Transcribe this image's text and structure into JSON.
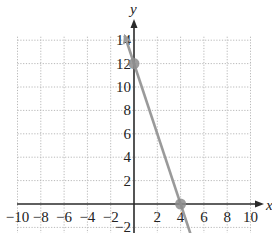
{
  "chart_data": {
    "type": "line",
    "title": "",
    "xlabel": "x",
    "ylabel": "y",
    "xlim": [
      -10,
      10
    ],
    "ylim": [
      -2,
      14
    ],
    "grid": true,
    "x_ticks": [
      -10,
      -8,
      -6,
      -4,
      -2,
      2,
      4,
      6,
      8,
      10
    ],
    "y_ticks": [
      -2,
      2,
      4,
      6,
      8,
      10,
      12,
      14
    ],
    "x_tick_labels": [
      "−10",
      "−8",
      "−6",
      "−4",
      "−2",
      "2",
      "4",
      "6",
      "8",
      "10"
    ],
    "y_tick_labels": [
      "−2",
      "2",
      "4",
      "6",
      "8",
      "10",
      "12",
      "14"
    ],
    "series": [
      {
        "name": "line",
        "equation": "y = -3x + 12",
        "x": [
          -0.8,
          4.85
        ],
        "y": [
          14.4,
          -2.55
        ],
        "color": "#9a9a9a"
      }
    ],
    "points": [
      {
        "x": 0,
        "y": 12,
        "label": "y-intercept"
      },
      {
        "x": 4,
        "y": 0,
        "label": "x-intercept"
      }
    ],
    "colors": {
      "axis": "#2a2a2a",
      "grid": "#b8b8b8",
      "line": "#9a9a9a",
      "point": "#8c8c8c"
    }
  }
}
